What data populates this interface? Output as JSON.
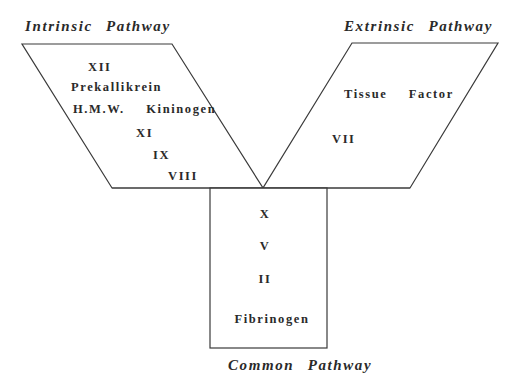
{
  "diagram": {
    "intrinsic": {
      "title": "Intrinsic Pathway",
      "factors": [
        "XII",
        "Prekallikrein",
        "H.M.W.  Kininogen",
        "XI",
        "IX",
        "VIII"
      ]
    },
    "extrinsic": {
      "title": "Extrinsic Pathway",
      "factors": [
        "Tissue  Factor",
        "VII"
      ]
    },
    "common": {
      "title": "Common Pathway",
      "factors": [
        "X",
        "V",
        "II",
        "Fibrinogen"
      ]
    },
    "colors": {
      "line": "#3a3a3a",
      "text": "#2a2a2a",
      "background": "#ffffff"
    }
  }
}
